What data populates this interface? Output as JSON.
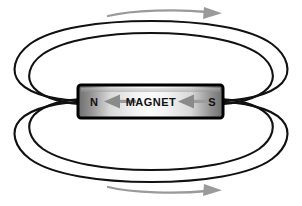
{
  "figure": {
    "background_color": "#ffffff",
    "width": 302,
    "height": 206
  },
  "magnet": {
    "body_label": "MAGNET",
    "north_pole_label": "N",
    "south_pole_label": "S",
    "border_color": "#000000",
    "fill_light": "#f2f2f2",
    "fill_dark": "#6e6e6e",
    "internal_arrow_color": "#8a8a8a",
    "internal_arrow_direction": "left",
    "internal_arrow_count": 2
  },
  "field_lines": {
    "color": "#111111",
    "loop_count": 4,
    "description": "two nested closed loops above and two nested closed loops below the magnet"
  },
  "direction_arrows": {
    "color": "#9a9a9a",
    "top_direction": "right",
    "bottom_direction": "right",
    "count": 2
  }
}
